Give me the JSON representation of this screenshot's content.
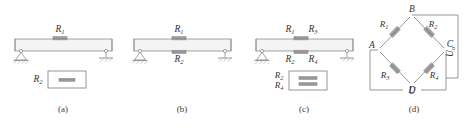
{
  "figure": {
    "panels": [
      {
        "caption": "(a)",
        "type": "quarter-bridge-beam",
        "beam_top_label": "R1",
        "beam_top_label_text": "R",
        "beam_top_sub": "1",
        "box_label_text": "R",
        "box_label_sub": "2",
        "gauges_on_beam": 1,
        "gauges_in_box": 1,
        "left_support": "pin",
        "right_support": "roller"
      },
      {
        "caption": "(b)",
        "type": "half-bridge-beam",
        "beam_top_label_text": "R",
        "beam_top_sub": "1",
        "beam_bottom_label_text": "R",
        "beam_bottom_sub": "2",
        "gauges_on_beam": 2,
        "gauges_in_box": 0,
        "left_support": "pin",
        "right_support": "roller"
      },
      {
        "caption": "(c)",
        "type": "full-bridge-beam",
        "beam_top_labels": [
          {
            "text": "R",
            "sub": "1"
          },
          {
            "text": "R",
            "sub": "3"
          }
        ],
        "beam_bottom_labels": [
          {
            "text": "R",
            "sub": "2"
          },
          {
            "text": "R",
            "sub": "4"
          }
        ],
        "box_labels": [
          {
            "text": "R",
            "sub": "2"
          },
          {
            "text": "R",
            "sub": "4"
          }
        ],
        "gauges_on_beam": 2,
        "gauges_in_box": 2,
        "left_support": "pin",
        "right_support": "roller"
      },
      {
        "caption": "(d)",
        "type": "wheatstone-bridge",
        "nodes": [
          "A",
          "B",
          "C",
          "D"
        ],
        "resistors": [
          {
            "text": "R",
            "sub": "1",
            "between": "A-B"
          },
          {
            "text": "R",
            "sub": "2",
            "between": "B-C"
          },
          {
            "text": "R",
            "sub": "3",
            "between": "A-D"
          },
          {
            "text": "R",
            "sub": "4",
            "between": "D-C"
          }
        ],
        "output_label_text": "U",
        "output_label_sub": "o",
        "supply_label_text": "U",
        "supply_label_sub": ""
      }
    ]
  },
  "colors": {
    "line": "#8a8a8a",
    "beam_fill": "#f2f2f2",
    "gauge": "#9a9a9a",
    "gauge_dark": "#7d7d7d",
    "text": "#333333",
    "hatch": "#8f8f8f"
  }
}
